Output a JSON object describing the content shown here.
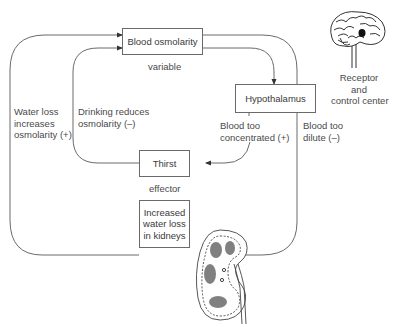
{
  "diagram": {
    "type": "negative-feedback-loop",
    "nodes": {
      "blood_osmolarity": {
        "label": "Blood osmolarity",
        "role": "variable"
      },
      "hypothalamus": {
        "label": "Hypothalamus"
      },
      "thirst": {
        "label": "Thirst",
        "role": "effector"
      },
      "kidneys": {
        "label": "Increased water loss in kidneys",
        "lines": [
          "Increased",
          "water loss",
          "in kidneys"
        ]
      }
    },
    "role_labels": {
      "variable": "variable",
      "effector": "effector"
    },
    "edge_labels": {
      "water_loss": [
        "Water loss",
        "increases",
        "osmolarity (+)"
      ],
      "drinking": [
        "Drinking reduces",
        "osmolarity (–)"
      ],
      "too_concentrated": [
        "Blood too",
        "concentrated (+)"
      ],
      "too_dilute": [
        "Blood too",
        "dilute (–)"
      ]
    },
    "brain_caption": [
      "Receptor",
      "and",
      "control center"
    ],
    "icons": {
      "brain": "brain-illustration",
      "kidney": "kidney-illustration"
    },
    "colors": {
      "line": "#6a6a6a",
      "text": "#3a3a3a"
    }
  }
}
